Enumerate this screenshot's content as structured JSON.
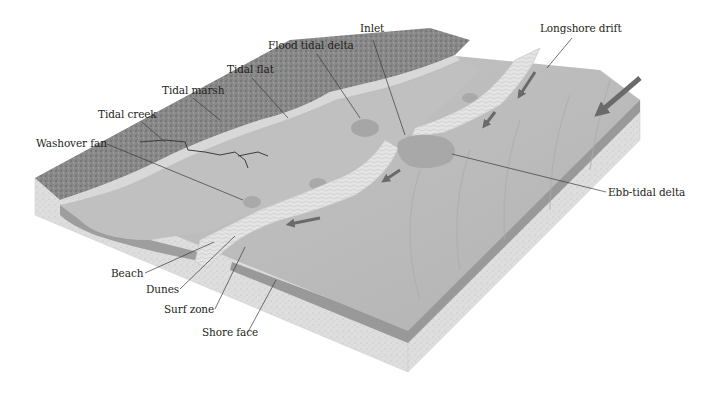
{
  "diagram": {
    "type": "block-diagram",
    "labels": {
      "inlet": "Inlet",
      "longshore_drift": "Longshore drift",
      "flood_tidal_delta": "Flood tidal delta",
      "tidal_flat": "Tidal flat",
      "tidal_marsh": "Tidal marsh",
      "tidal_creek": "Tidal creek",
      "washover_fan": "Washover fan",
      "ebb_tidal_delta": "Ebb-tidal delta",
      "beach": "Beach",
      "dunes": "Dunes",
      "surf_zone": "Surf zone",
      "shore_face": "Shore face"
    },
    "colors": {
      "background": "#ffffff",
      "label_text": "#231f20",
      "leader_line": "#3a3a3a",
      "ocean_surface": "#b9b9b9",
      "lagoon": "#c4c4c4",
      "marsh": "#7d7d7d",
      "barrier_sand": "#e2e2e2",
      "sediment_block": "#dcdcdc",
      "shore_edge": "#8d8d8d",
      "arrow": "#6a6a6a"
    }
  }
}
